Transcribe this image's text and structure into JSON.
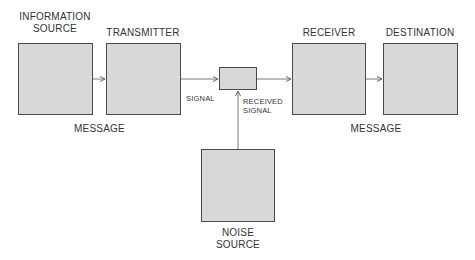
{
  "diagram": {
    "title_nodes": {
      "information_source": {
        "line1": "INFORMATION",
        "line2": "SOURCE"
      },
      "transmitter": {
        "label": "TRANSMITTER"
      },
      "receiver": {
        "label": "RECEIVER"
      },
      "destination": {
        "label": "DESTINATION"
      },
      "noise_source": {
        "line1": "NOISE",
        "line2": "SOURCE"
      }
    },
    "edge_labels": {
      "message_left": "MESSAGE",
      "signal": "SIGNAL",
      "received_signal_line1": "RECEIVED",
      "received_signal_line2": "SIGNAL",
      "message_right": "MESSAGE"
    },
    "colors": {
      "box_fill": "#d8d8d8",
      "box_border": "#4a4a4a",
      "line": "#666666",
      "text": "#333333"
    }
  }
}
